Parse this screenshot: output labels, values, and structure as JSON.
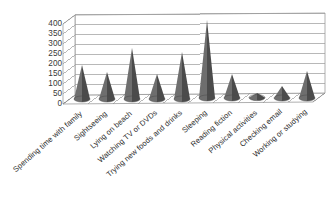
{
  "chart_data": {
    "type": "bar",
    "subtype": "3d-cone",
    "title": "",
    "subtitle": "",
    "xlabel": "",
    "ylabel": "",
    "ylim": [
      0,
      400
    ],
    "ytick_interval": 50,
    "grid": true,
    "legend": false,
    "legend_position": "none",
    "categories": [
      "Spending time with family",
      "Sightseeing",
      "Lying on beach",
      "Watching TV or DVDs",
      "Trying new foods and drinks",
      "Sleeping",
      "Reading fiction",
      "Physical activities",
      "Checking email",
      "Working or studying"
    ],
    "values": [
      155,
      120,
      240,
      110,
      220,
      375,
      105,
      8,
      45,
      120
    ],
    "yticks": [
      "0",
      "50",
      "100",
      "150",
      "200",
      "250",
      "300",
      "350",
      "400"
    ],
    "series_color": "#6e6e6e",
    "series_shade_color": "#4b4b4b",
    "axis_color": "#8c8c8c",
    "grid_color": "#9a9a9a",
    "text_color": "#2d2d2d",
    "background": "#ffffff"
  }
}
